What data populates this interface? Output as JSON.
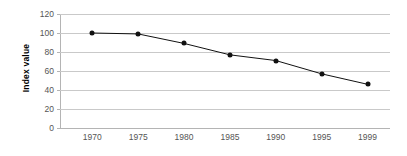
{
  "chart_data": {
    "type": "line",
    "title": "",
    "subtitle": "",
    "xlabel": "",
    "ylabel": "Index value",
    "categories": [
      "1970",
      "1975",
      "1980",
      "1985",
      "1990",
      "1995",
      "1999"
    ],
    "values": [
      100,
      99,
      89,
      77,
      71,
      57,
      46
    ],
    "series": [
      {
        "name": "Index value",
        "values": [
          100,
          99,
          89,
          77,
          71,
          57,
          46
        ]
      }
    ],
    "ylim": [
      0,
      120
    ],
    "yticks": [
      0,
      20,
      40,
      60,
      80,
      100,
      120
    ],
    "ytick_labels": [
      "0",
      "20",
      "40",
      "60",
      "80",
      "100",
      "120"
    ],
    "xtick_labels": [
      "1970",
      "1975",
      "1980",
      "1985",
      "1990",
      "1995",
      "1999"
    ],
    "grid": "horizontal",
    "legend": "none",
    "annotations": [],
    "colors": {
      "line": "#111111",
      "marker": "#111111",
      "gridline": "#c9c9c9",
      "axis": "#b4b4b4",
      "tick_label": "#555555",
      "axis_title": "#000000",
      "background": "#ffffff"
    }
  }
}
